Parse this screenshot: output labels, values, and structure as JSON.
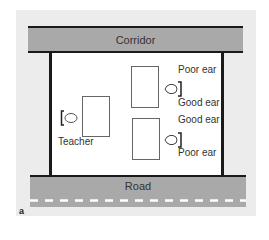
{
  "diagram": {
    "figure_label": "a",
    "corridor_label": "Corridor",
    "road_label": "Road",
    "teacher": {
      "label": "Teacher",
      "icon": "head-facing-right-icon"
    },
    "students": [
      {
        "position": "top",
        "ear_top_label": "Poor ear",
        "ear_bottom_label": "Good ear",
        "icon": "head-facing-left-icon"
      },
      {
        "position": "bottom",
        "ear_top_label": "Good ear",
        "ear_bottom_label": "Poor ear",
        "icon": "head-facing-left-icon"
      }
    ],
    "colors": {
      "background_panel": "#ececec",
      "band": "#a9a9a9",
      "wall": "#1a1a1a",
      "room": "#ffffff",
      "road_dash": "#ffffff"
    }
  }
}
